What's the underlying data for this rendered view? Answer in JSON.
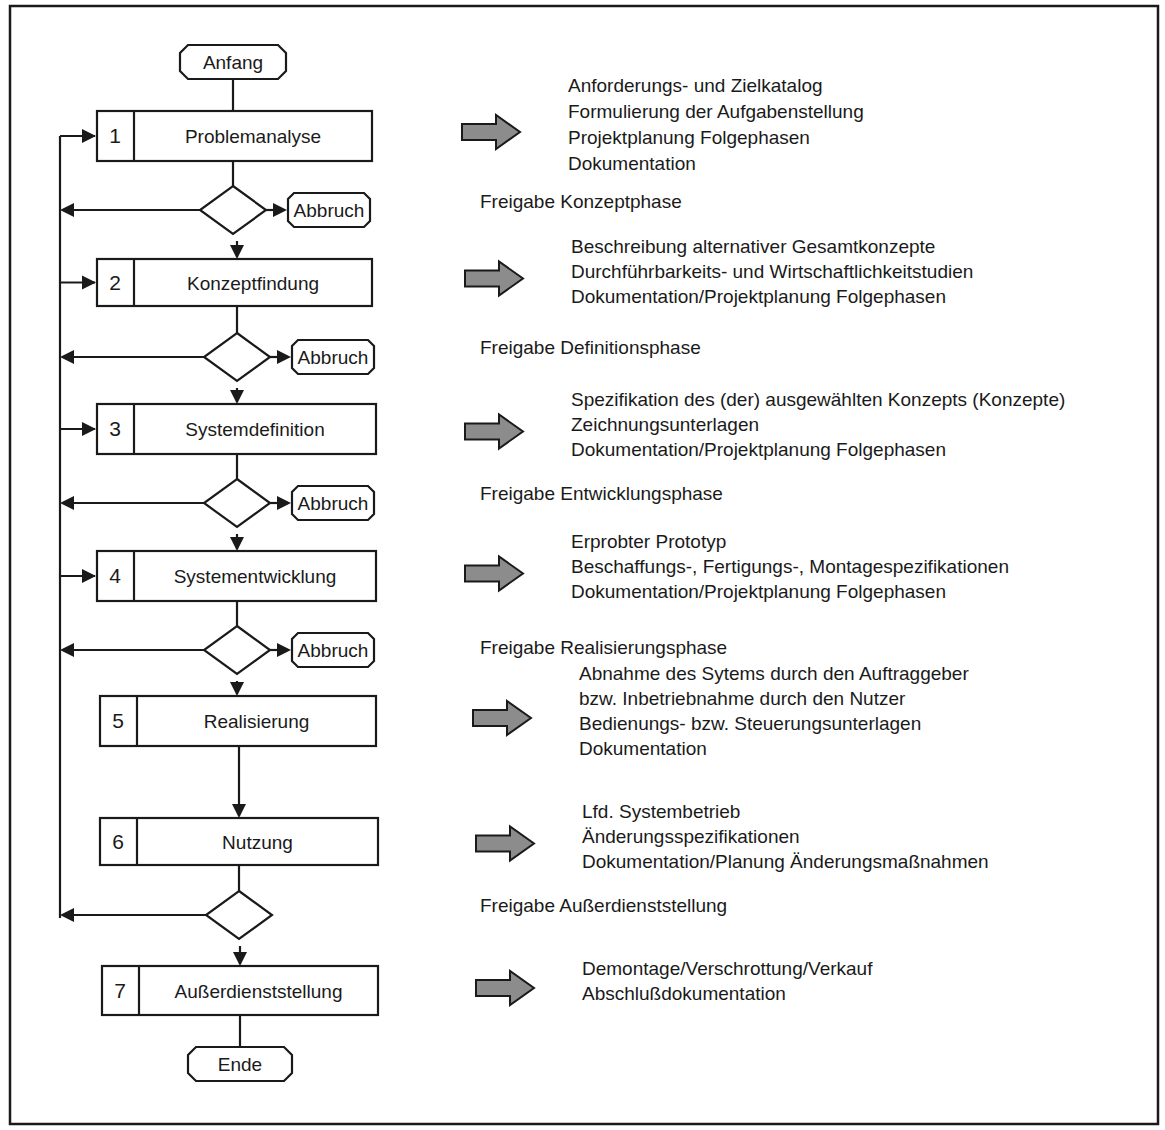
{
  "terminals": {
    "start": "Anfang",
    "end": "Ende",
    "abort": "Abbruch"
  },
  "phases": [
    {
      "num": "1",
      "name": "Problemanalyse",
      "results": [
        "Anforderungs- und Zielkatalog",
        "Formulierung der Aufgabenstellung",
        "Projektplanung Folgephasen",
        "Dokumentation"
      ],
      "release": "Freigabe Konzeptphase",
      "has_abort": true
    },
    {
      "num": "2",
      "name": "Konzeptfindung",
      "results": [
        "Beschreibung alternativer Gesamtkonzepte",
        "Durchführbarkeits- und Wirtschaftlichkeitstudien",
        "Dokumentation/Projektplanung Folgephasen"
      ],
      "release": "Freigabe Definitionsphase",
      "has_abort": true
    },
    {
      "num": "3",
      "name": "Systemdefinition",
      "results": [
        "Spezifikation des (der) ausgewählten Konzepts (Konzepte)",
        "Zeichnungsunterlagen",
        "Dokumentation/Projektplanung Folgephasen"
      ],
      "release": "Freigabe Entwicklungsphase",
      "has_abort": true
    },
    {
      "num": "4",
      "name": "Systementwicklung",
      "results": [
        "Erprobter Prototyp",
        "Beschaffungs-, Fertigungs-, Montagespezifikationen",
        "Dokumentation/Projektplanung Folgephasen"
      ],
      "release": "Freigabe Realisierungsphase",
      "has_abort": true
    },
    {
      "num": "5",
      "name": "Realisierung",
      "results": [
        "Abnahme des Sytems durch den Auftraggeber",
        "bzw. Inbetriebnahme durch den Nutzer",
        "Bedienungs- bzw. Steuerungsunterlagen",
        "Dokumentation"
      ],
      "release": "",
      "has_abort": false
    },
    {
      "num": "6",
      "name": "Nutzung",
      "results": [
        "Lfd. Systembetrieb",
        "Änderungsspezifikationen",
        "Dokumentation/Planung Änderungsmaßnahmen"
      ],
      "release": "Freigabe Außerdienststellung",
      "has_abort": false
    },
    {
      "num": "7",
      "name": "Außerdienststellung",
      "results": [
        "Demontage/Verschrottung/Verkauf",
        "Abschlußdokumentation"
      ],
      "release": "",
      "has_abort": false
    }
  ]
}
